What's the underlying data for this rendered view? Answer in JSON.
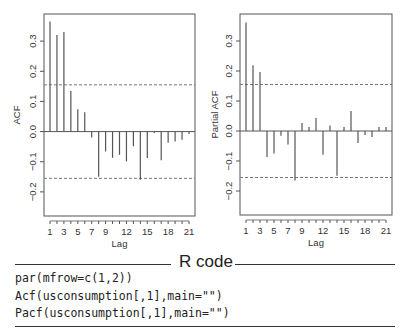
{
  "chart_data": [
    {
      "type": "bar",
      "panel": "left",
      "title": "",
      "xlabel": "Lag",
      "ylabel": "ACF",
      "x": [
        1,
        2,
        3,
        4,
        5,
        6,
        7,
        8,
        9,
        10,
        11,
        12,
        13,
        14,
        15,
        16,
        17,
        18,
        19,
        20,
        21
      ],
      "values": [
        0.365,
        0.32,
        0.33,
        0.135,
        0.074,
        0.064,
        -0.02,
        -0.15,
        -0.066,
        -0.087,
        -0.077,
        -0.099,
        -0.049,
        -0.16,
        -0.088,
        -0.005,
        -0.095,
        -0.037,
        -0.033,
        -0.027,
        -0.008
      ],
      "ci": 0.155,
      "ylim": [
        -0.28,
        0.39
      ],
      "yticks": [
        -0.2,
        -0.1,
        0.0,
        0.1,
        0.2,
        0.3
      ],
      "ytick_labels": [
        "−0.2",
        "−0.1",
        "0.0",
        "0.1",
        "0.2",
        "0.3"
      ],
      "xticks_labeled": [
        1,
        3,
        5,
        7,
        9,
        12,
        15,
        18,
        21
      ],
      "grid": false,
      "ci_style": "dashed"
    },
    {
      "type": "bar",
      "panel": "right",
      "title": "",
      "xlabel": "Lag",
      "ylabel": "Partial ACF",
      "x": [
        1,
        2,
        3,
        4,
        5,
        6,
        7,
        8,
        9,
        10,
        11,
        12,
        13,
        14,
        15,
        16,
        17,
        18,
        19,
        20,
        21
      ],
      "values": [
        0.362,
        0.219,
        0.197,
        -0.087,
        -0.075,
        -0.016,
        -0.045,
        -0.165,
        0.027,
        0.013,
        0.043,
        -0.079,
        0.018,
        -0.149,
        0.013,
        0.067,
        -0.04,
        -0.013,
        -0.02,
        0.013,
        0.013
      ],
      "ci": 0.155,
      "ylim": [
        -0.28,
        0.39
      ],
      "yticks": [
        -0.2,
        -0.1,
        0.0,
        0.1,
        0.2,
        0.3
      ],
      "ytick_labels": [
        "−0.2",
        "−0.1",
        "0.0",
        "0.1",
        "0.2",
        "0.3"
      ],
      "xticks_labeled": [
        1,
        3,
        5,
        7,
        9,
        12,
        15,
        18,
        21
      ],
      "grid": false,
      "ci_style": "dashed"
    }
  ],
  "code_section": {
    "title": "R code",
    "lines": [
      "par(mfrow=c(1,2))",
      "Acf(usconsumption[,1],main=\"\")",
      "Pacf(usconsumption[,1],main=\"\")"
    ]
  },
  "colors": {
    "bar": "#555555",
    "axis": "#555555",
    "ci_line": "#777777",
    "text": "#333333"
  }
}
